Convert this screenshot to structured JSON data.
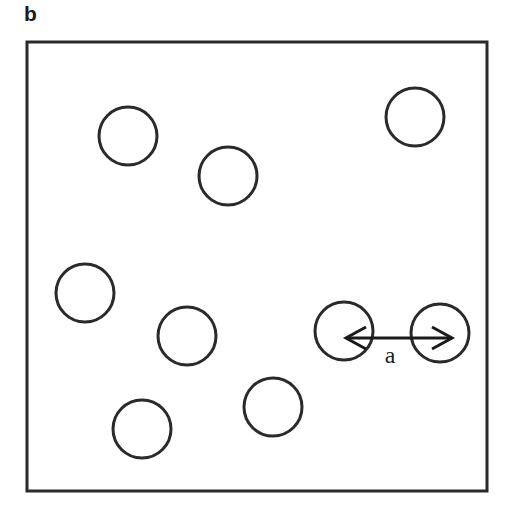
{
  "panel_label": "b",
  "frame": {
    "x": 27,
    "y": 42,
    "width": 460,
    "height": 449,
    "stroke": "#2a2a2a"
  },
  "particles": {
    "radius": 29,
    "stroke": "#2a2a2a",
    "items": [
      {
        "cx": 128,
        "cy": 136
      },
      {
        "cx": 228,
        "cy": 176
      },
      {
        "cx": 415,
        "cy": 117
      },
      {
        "cx": 85,
        "cy": 293
      },
      {
        "cx": 187,
        "cy": 336
      },
      {
        "cx": 344,
        "cy": 331
      },
      {
        "cx": 440,
        "cy": 333
      },
      {
        "cx": 273,
        "cy": 407
      },
      {
        "cx": 142,
        "cy": 429
      }
    ]
  },
  "distance_arrow": {
    "x1": 346,
    "x2": 452,
    "y": 338,
    "label": "a",
    "label_x": 390,
    "label_y": 363
  }
}
